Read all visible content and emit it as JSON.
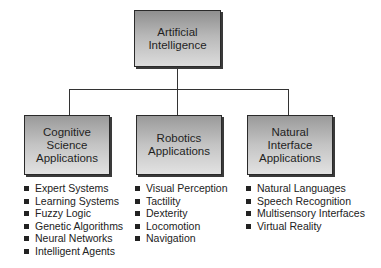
{
  "diagram": {
    "root": {
      "label": "Artificial\nIntelligence"
    },
    "children": [
      {
        "label": "Cognitive\nScience\nApplications",
        "items": [
          "Expert Systems",
          "Learning Systems",
          "Fuzzy Logic",
          "Genetic Algorithms",
          "Neural Networks",
          "Intelligent Agents"
        ]
      },
      {
        "label": "Robotics\nApplications",
        "items": [
          "Visual Perception",
          "Tactility",
          "Dexterity",
          "Locomotion",
          "Navigation"
        ]
      },
      {
        "label": "Natural\nInterface\nApplications",
        "items": [
          "Natural Languages",
          "Speech Recognition",
          "Multisensory Interfaces",
          "Virtual Reality"
        ]
      }
    ]
  }
}
